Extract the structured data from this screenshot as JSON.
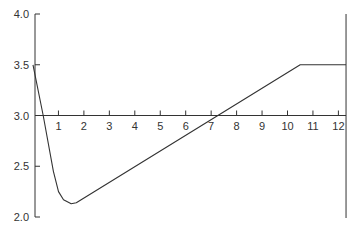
{
  "chart_data": {
    "type": "line",
    "title": "",
    "xlabel": "",
    "ylabel": "",
    "xlim": [
      0,
      12.3
    ],
    "ylim": [
      2.0,
      4.0
    ],
    "grid": false,
    "x_axis_at_y": 3.0,
    "xticks": [
      1,
      2,
      3,
      4,
      5,
      6,
      7,
      8,
      9,
      10,
      11,
      12
    ],
    "xtick_labels": [
      "1",
      "2",
      "3",
      "4",
      "5",
      "6",
      "7",
      "8",
      "9",
      "10",
      "11",
      "12"
    ],
    "yticks": [
      4.0,
      3.5,
      3.0,
      2.5,
      2.0
    ],
    "ytick_labels": [
      "4.0",
      "3.5",
      "3.0",
      "2.5",
      "2.0"
    ],
    "series": [
      {
        "name": "curve",
        "x": [
          0,
          0.4,
          0.8,
          1.0,
          1.2,
          1.5,
          1.7,
          10.5,
          12.3
        ],
        "y": [
          3.5,
          3.0,
          2.45,
          2.25,
          2.17,
          2.13,
          2.14,
          3.5,
          3.5
        ]
      }
    ],
    "right_boundary_x": 12.3
  }
}
